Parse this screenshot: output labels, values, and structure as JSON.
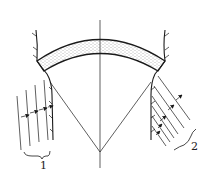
{
  "diagram": {
    "type": "arch-dam-cross-section",
    "labels": {
      "left": "1",
      "right": "2"
    },
    "colors": {
      "stroke": "#1a1a1a",
      "fill": "#ffffff",
      "stipple": "#555555"
    }
  }
}
